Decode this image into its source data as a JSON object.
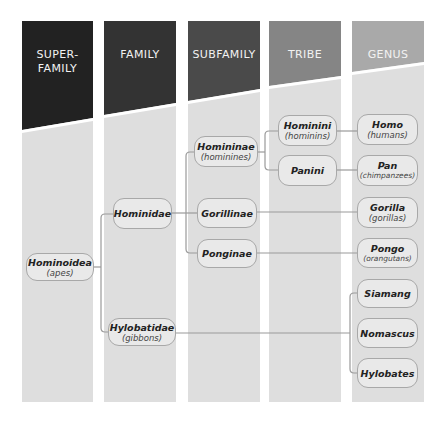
{
  "columns": [
    {
      "label_line1": "SUPER-",
      "label_line2": "FAMILY",
      "color": "#222222",
      "x": 22,
      "w": 71
    },
    {
      "label_line1": "FAMILY",
      "label_line2": "",
      "color": "#333333",
      "x": 104,
      "w": 72
    },
    {
      "label_line1": "SUBFAMILY",
      "label_line2": "",
      "color": "#4a4a4a",
      "x": 188,
      "w": 72
    },
    {
      "label_line1": "TRIBE",
      "label_line2": "",
      "color": "#858585",
      "x": 269,
      "w": 72
    },
    {
      "label_line1": "GENUS",
      "label_line2": "",
      "color": "#a9a9a9",
      "x": 352,
      "w": 72
    }
  ],
  "nodes": {
    "hominoidea": {
      "name": "Hominoidea",
      "common": "(apes)"
    },
    "hominidae": {
      "name": "Hominidae",
      "common": ""
    },
    "hylobatidae": {
      "name": "Hylobatidae",
      "common": "(gibbons)"
    },
    "homininae": {
      "name": "Homininae",
      "common": "(hominines)"
    },
    "gorillinae": {
      "name": "Gorillinae",
      "common": ""
    },
    "ponginae": {
      "name": "Ponginae",
      "common": ""
    },
    "hominini": {
      "name": "Hominini",
      "common": "(hominins)"
    },
    "panini": {
      "name": "Panini",
      "common": ""
    },
    "homo": {
      "name": "Homo",
      "common": "(humans)"
    },
    "pan": {
      "name": "Pan",
      "common": "(chimpanzees)"
    },
    "gorilla": {
      "name": "Gorilla",
      "common": "(gorillas)"
    },
    "pongo": {
      "name": "Pongo",
      "common": "(orangutans)"
    },
    "siamang": {
      "name": "Siamang",
      "common": ""
    },
    "nomascus": {
      "name": "Nomascus",
      "common": ""
    },
    "hylobates": {
      "name": "Hylobates",
      "common": ""
    }
  },
  "colors": {
    "column_bg": "#dedede",
    "node_fill": "#e9e9e9",
    "node_border": "#a8a8a8",
    "connector": "#9a9a9a"
  }
}
